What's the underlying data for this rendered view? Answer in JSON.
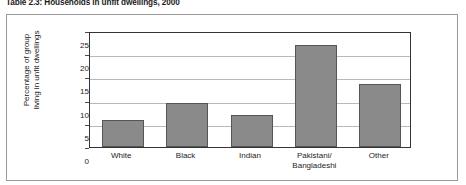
{
  "figure": {
    "title": "Table 2.3: Households in unfit dwellings, 2000"
  },
  "chart_data": {
    "type": "bar",
    "title": "Table 2.3: Households in unfit dwellings, 2000",
    "categories": [
      "White",
      "Black",
      "Indian",
      "Pakistani/\nBangladeshi",
      "Other"
    ],
    "category_lines": [
      [
        "White"
      ],
      [
        "Black"
      ],
      [
        "Indian"
      ],
      [
        "Pakistani/",
        "Bangladeshi"
      ],
      [
        "Other"
      ]
    ],
    "values": [
      6.0,
      9.7,
      7.1,
      22.4,
      13.8
    ],
    "xlabel": "",
    "ylabel": "Percentage of group living in unfit dwellings",
    "ylabel_lines": [
      "Percentage of group",
      "living in unfit dwellings"
    ],
    "ylim": [
      0,
      25
    ],
    "yticks": [
      0,
      5,
      10,
      15,
      20,
      25
    ],
    "ytick_labels": [
      "0",
      "5",
      "10",
      "15",
      "20",
      "25"
    ],
    "grid": true,
    "grid_axis": "y",
    "legend": false,
    "bar_color": "#8a8a8a",
    "bar_edge_color": "#555555",
    "axis_color": "#333333",
    "gridline_color": "#b9b9b9",
    "frame_color": "#9a9a9a",
    "background": "#ffffff"
  }
}
